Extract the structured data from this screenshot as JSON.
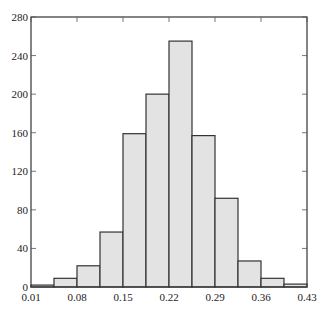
{
  "chart_data": {
    "type": "bar",
    "subtype": "histogram",
    "title": "",
    "xlabel": "",
    "ylabel": "",
    "bin_edges": [
      0.01,
      0.045,
      0.08,
      0.115,
      0.15,
      0.185,
      0.22,
      0.255,
      0.29,
      0.325,
      0.36,
      0.395,
      0.43
    ],
    "values": [
      2,
      9,
      22,
      57,
      159,
      200,
      255,
      157,
      92,
      27,
      9,
      3
    ],
    "xlim": [
      0.01,
      0.43
    ],
    "ylim": [
      0,
      280
    ],
    "x_ticks": [
      "0.01",
      "0.08",
      "0.15",
      "0.22",
      "0.29",
      "0.36",
      "0.43"
    ],
    "y_ticks": [
      "0",
      "40",
      "80",
      "120",
      "160",
      "200",
      "240",
      "280"
    ],
    "grid": false,
    "legend": null,
    "colors": {
      "bar_fill": "#e3e3e3",
      "bar_edge": "#333333",
      "axis": "#333333"
    }
  }
}
